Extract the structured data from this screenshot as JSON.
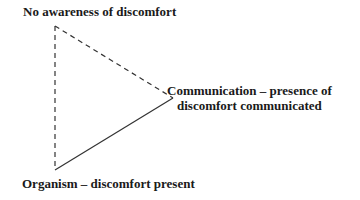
{
  "diagram": {
    "type": "triangle",
    "nodes": [
      {
        "id": "top",
        "label": "No awareness of discomfort",
        "vertex": [
          55,
          26
        ]
      },
      {
        "id": "right",
        "label_lines": [
          "Communication – presence of",
          "discomfort communicated"
        ],
        "vertex": [
          173,
          98
        ]
      },
      {
        "id": "bottom",
        "label": "Organism – discomfort present",
        "vertex": [
          55,
          170
        ]
      }
    ],
    "edges": [
      {
        "from": "top",
        "to": "bottom",
        "style": "dashed"
      },
      {
        "from": "top",
        "to": "right",
        "style": "dashed"
      },
      {
        "from": "bottom",
        "to": "right",
        "style": "solid"
      }
    ],
    "colors": {
      "line": "#333333",
      "text": "#1a1a1a",
      "background": "#ffffff"
    }
  }
}
